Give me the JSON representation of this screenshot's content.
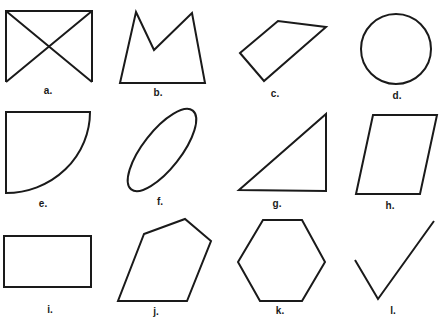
{
  "figure": {
    "stroke_color": "#1a1a1a",
    "background": "#ffffff",
    "shapes": [
      {
        "id": "a",
        "label": "a.",
        "kind": "rectangle-with-diagonals"
      },
      {
        "id": "b",
        "label": "b.",
        "kind": "concave-pentagon"
      },
      {
        "id": "c",
        "label": "c.",
        "kind": "quadrilateral"
      },
      {
        "id": "d",
        "label": "d.",
        "kind": "circle"
      },
      {
        "id": "e",
        "label": "e.",
        "kind": "quarter-circle"
      },
      {
        "id": "f",
        "label": "f.",
        "kind": "ellipse"
      },
      {
        "id": "g",
        "label": "g.",
        "kind": "right-triangle"
      },
      {
        "id": "h",
        "label": "h.",
        "kind": "parallelogram"
      },
      {
        "id": "i",
        "label": "i.",
        "kind": "rectangle"
      },
      {
        "id": "j",
        "label": "j.",
        "kind": "irregular-pentagon"
      },
      {
        "id": "k",
        "label": "k.",
        "kind": "hexagon"
      },
      {
        "id": "l",
        "label": "l.",
        "kind": "open-angle"
      }
    ]
  }
}
